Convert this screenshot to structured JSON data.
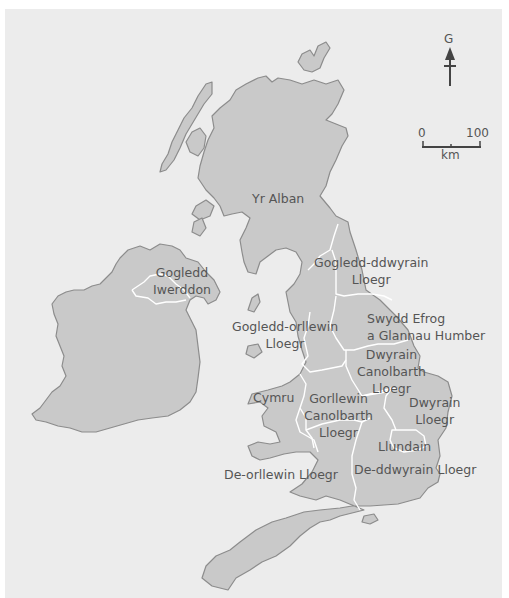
{
  "map": {
    "title": "Regions of the United Kingdom (Welsh labels)",
    "colors": {
      "background": "#ffffff",
      "panel": "#ececec",
      "land": "#c9c9c9",
      "coastline": "#8c8c8c",
      "region_border": "#ffffff",
      "text": "#555555"
    },
    "compass": {
      "label": "G",
      "meaning": "north-arrow"
    },
    "scale_bar": {
      "start": "0",
      "end": "100",
      "unit": "km"
    },
    "regions": [
      {
        "id": "scotland",
        "lines": [
          "Yr Alban"
        ]
      },
      {
        "id": "northern-ireland",
        "lines": [
          "Gogledd",
          "Iwerddon"
        ]
      },
      {
        "id": "north-east-england",
        "lines": [
          "Gogledd-ddwyrain",
          "Lloegr"
        ]
      },
      {
        "id": "north-west-england",
        "lines": [
          "Gogledd-orllewin",
          "Lloegr"
        ]
      },
      {
        "id": "yorkshire-humber",
        "lines": [
          "Swydd Efrog",
          "a Glannau Humber"
        ]
      },
      {
        "id": "east-midlands",
        "lines": [
          "Dwyrain",
          "Canolbarth",
          "Lloegr"
        ]
      },
      {
        "id": "wales",
        "lines": [
          "Cymru"
        ]
      },
      {
        "id": "west-midlands",
        "lines": [
          "Gorllewin",
          "Canolbarth",
          "Lloegr"
        ]
      },
      {
        "id": "east-of-england",
        "lines": [
          "Dwyrain",
          "Lloegr"
        ]
      },
      {
        "id": "london",
        "lines": [
          "Llundain"
        ]
      },
      {
        "id": "south-west-england",
        "lines": [
          "De-orllewin Lloegr"
        ]
      },
      {
        "id": "south-east-england",
        "lines": [
          "De-ddwyrain Lloegr"
        ]
      }
    ]
  }
}
